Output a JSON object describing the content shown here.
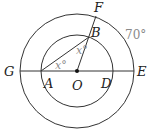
{
  "diagram": {
    "center": {
      "x": 77,
      "y": 71
    },
    "outer_radius": 57,
    "inner_radius": 36,
    "colors": {
      "stroke": "#333333",
      "label": "#222222",
      "annotation": "#8a8a8a"
    },
    "points": {
      "F": {
        "label": "F",
        "x": 96,
        "y": 16
      },
      "B": {
        "label": "B",
        "x": 89,
        "y": 37
      },
      "G": {
        "label": "G",
        "x": 20,
        "y": 71
      },
      "A": {
        "label": "A",
        "x": 41,
        "y": 71
      },
      "O": {
        "label": "O",
        "x": 77,
        "y": 71
      },
      "D": {
        "label": "D",
        "x": 113,
        "y": 71
      },
      "E": {
        "label": "E",
        "x": 134,
        "y": 71
      }
    },
    "angle_labels": {
      "at_A": "x°",
      "at_B": "x°",
      "arc_EF": "70°"
    }
  }
}
